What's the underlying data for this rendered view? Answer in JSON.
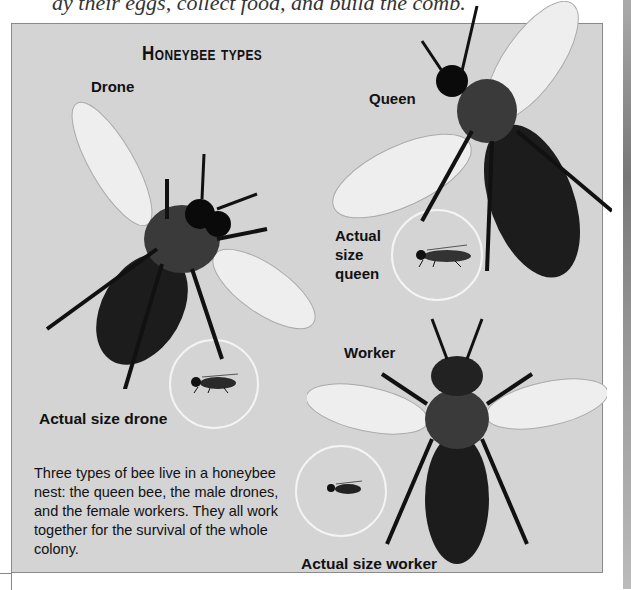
{
  "top_text": "ay their eggs, collect food, and build the comb.",
  "panel": {
    "title": "Honeybee types",
    "labels": {
      "drone": "Drone",
      "queen": "Queen",
      "worker": "Worker",
      "actual_drone": "Actual size drone",
      "actual_queen_line1": "Actual",
      "actual_queen_line2": "size",
      "actual_queen_line3": "queen",
      "actual_worker": "Actual size worker"
    },
    "body_text": "Three types of bee live in a honeybee nest: the queen bee, the male drones, and the female workers. They all work together for the survival of the whole colony."
  },
  "colors": {
    "panel_bg": "#d4d4d4",
    "panel_border": "#8a8a8a",
    "circle": "#f4f4f4",
    "bee_body": "#1c1c1c",
    "wing": "#eeeeee"
  }
}
